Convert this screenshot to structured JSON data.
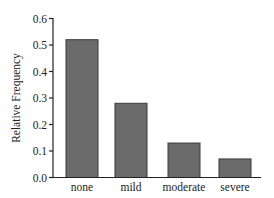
{
  "chart_data": {
    "type": "bar",
    "title": "",
    "xlabel": "",
    "ylabel": "Relative Frequency",
    "categories": [
      "none",
      "mild",
      "moderate",
      "severe"
    ],
    "values": [
      0.52,
      0.28,
      0.13,
      0.07
    ],
    "ylim": [
      0.0,
      0.6
    ],
    "yticks": [
      "0.0",
      "0.1",
      "0.2",
      "0.3",
      "0.4",
      "0.5",
      "0.6"
    ],
    "grid": false,
    "legend": null,
    "colors": {
      "bar_fill": "#6b6b6b",
      "bar_stroke": "#3a3a3a",
      "axis": "#222222"
    }
  }
}
